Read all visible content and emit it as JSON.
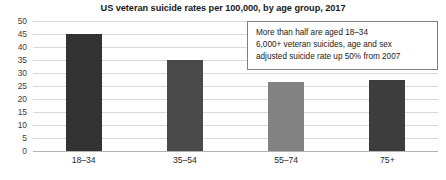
{
  "chart_data": {
    "type": "bar",
    "title": "US veteran suicide rates per 100,000, by age group, 2017",
    "xlabel": "",
    "ylabel": "",
    "categories": [
      "18–34",
      "35–54",
      "55–74",
      "75+"
    ],
    "values": [
      45,
      35,
      26.5,
      27.5
    ],
    "ylim": [
      0,
      50
    ],
    "y_ticks": [
      50,
      45,
      40,
      35,
      30,
      25,
      20,
      15,
      10,
      5,
      0
    ],
    "grid": true,
    "legend": "none",
    "bar_colors": [
      "#333333",
      "#4a4a4a",
      "#828282",
      "#3d3d3d"
    ],
    "annotations": [
      "More than half are aged 18–34",
      "6,000+ veteran suicides, age and sex",
      "adjusted suicide rate up 50% from 2007"
    ]
  },
  "colors": {
    "gridline": "#d9d9d9",
    "axis": "#b3b3b3",
    "annotation_border": "#808080",
    "text": "#1a1a1a",
    "background": "#ffffff"
  }
}
